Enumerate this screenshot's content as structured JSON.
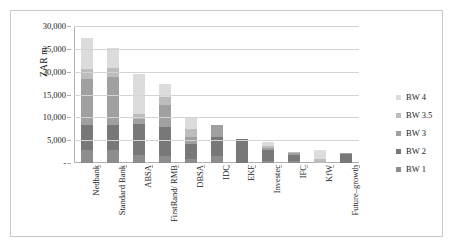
{
  "chart_data": {
    "type": "bar",
    "subtype": "stacked-vertical",
    "title": "",
    "xlabel": "",
    "ylabel": "ZAR m",
    "ylim": [
      0,
      30000
    ],
    "ytick_labels": [
      "30,000",
      "25,000",
      "20,000",
      "15,000",
      "10,000",
      "5,000",
      "-"
    ],
    "ytick_values": [
      30000,
      25000,
      20000,
      15000,
      10000,
      5000,
      0
    ],
    "grid": true,
    "legend_position": "right",
    "categories": [
      "Nedbank",
      "Standard Bank",
      "ABSA",
      "FirstRand/ RMB",
      "DBSA",
      "IDC",
      "EKF",
      "Investec",
      "IFC",
      "KfW",
      "Future–growth"
    ],
    "series": [
      {
        "name": "BW 1",
        "color": "#8d8d8d",
        "values": [
          2900,
          2800,
          1800,
          1500,
          900,
          1500,
          0,
          500,
          500,
          0,
          0
        ]
      },
      {
        "name": "BW 2",
        "color": "#787878",
        "values": [
          5400,
          5500,
          6800,
          6400,
          3300,
          4300,
          5300,
          2300,
          1200,
          0,
          1900
        ]
      },
      {
        "name": "BW 3",
        "color": "#a0a0a0",
        "values": [
          10000,
          10500,
          1100,
          4700,
          1500,
          2600,
          0,
          400,
          400,
          0,
          300
        ]
      },
      {
        "name": "BW 3.5",
        "color": "#bdbdbd",
        "values": [
          2200,
          2100,
          1100,
          1900,
          1800,
          0,
          0,
          500,
          400,
          800,
          0
        ]
      },
      {
        "name": "BW 4",
        "color": "#dcdcdc",
        "values": [
          6800,
          4200,
          8700,
          2800,
          2400,
          0,
          0,
          900,
          0,
          2100,
          0
        ]
      }
    ],
    "totals": [
      27300,
      25100,
      19500,
      17300,
      9900,
      8400,
      5300,
      4600,
      2500,
      2900,
      2200
    ],
    "legend_entries": [
      "BW 4",
      "BW 3.5",
      "BW 3",
      "BW 2",
      "BW 1"
    ],
    "colors": {
      "bw1": "#8d8d8d",
      "bw2": "#787878",
      "bw3": "#a0a0a0",
      "bw35": "#bdbdbd",
      "bw4": "#dcdcdc",
      "gridline": "#d4d4d4",
      "axis": "#b0b0b0",
      "border": "#c9c9c9",
      "background": "#ffffff"
    }
  }
}
